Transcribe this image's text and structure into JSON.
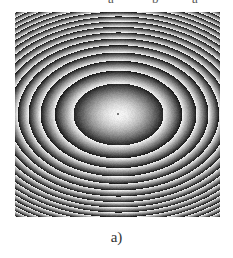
{
  "top_fragments": [
    {
      "text": "a",
      "x": 108
    },
    {
      "text": "b",
      "x": 152
    },
    {
      "text": "a",
      "x": 192
    }
  ],
  "figure": {
    "center": [
      103,
      102
    ],
    "radius_x_first_fringe": 45,
    "radius_y_first_fringe": 31,
    "fringe_profile": "sawtooth-quadratic",
    "colors": {
      "bright": "#f4f4f4",
      "dark": "#141414"
    }
  },
  "caption": "a)"
}
